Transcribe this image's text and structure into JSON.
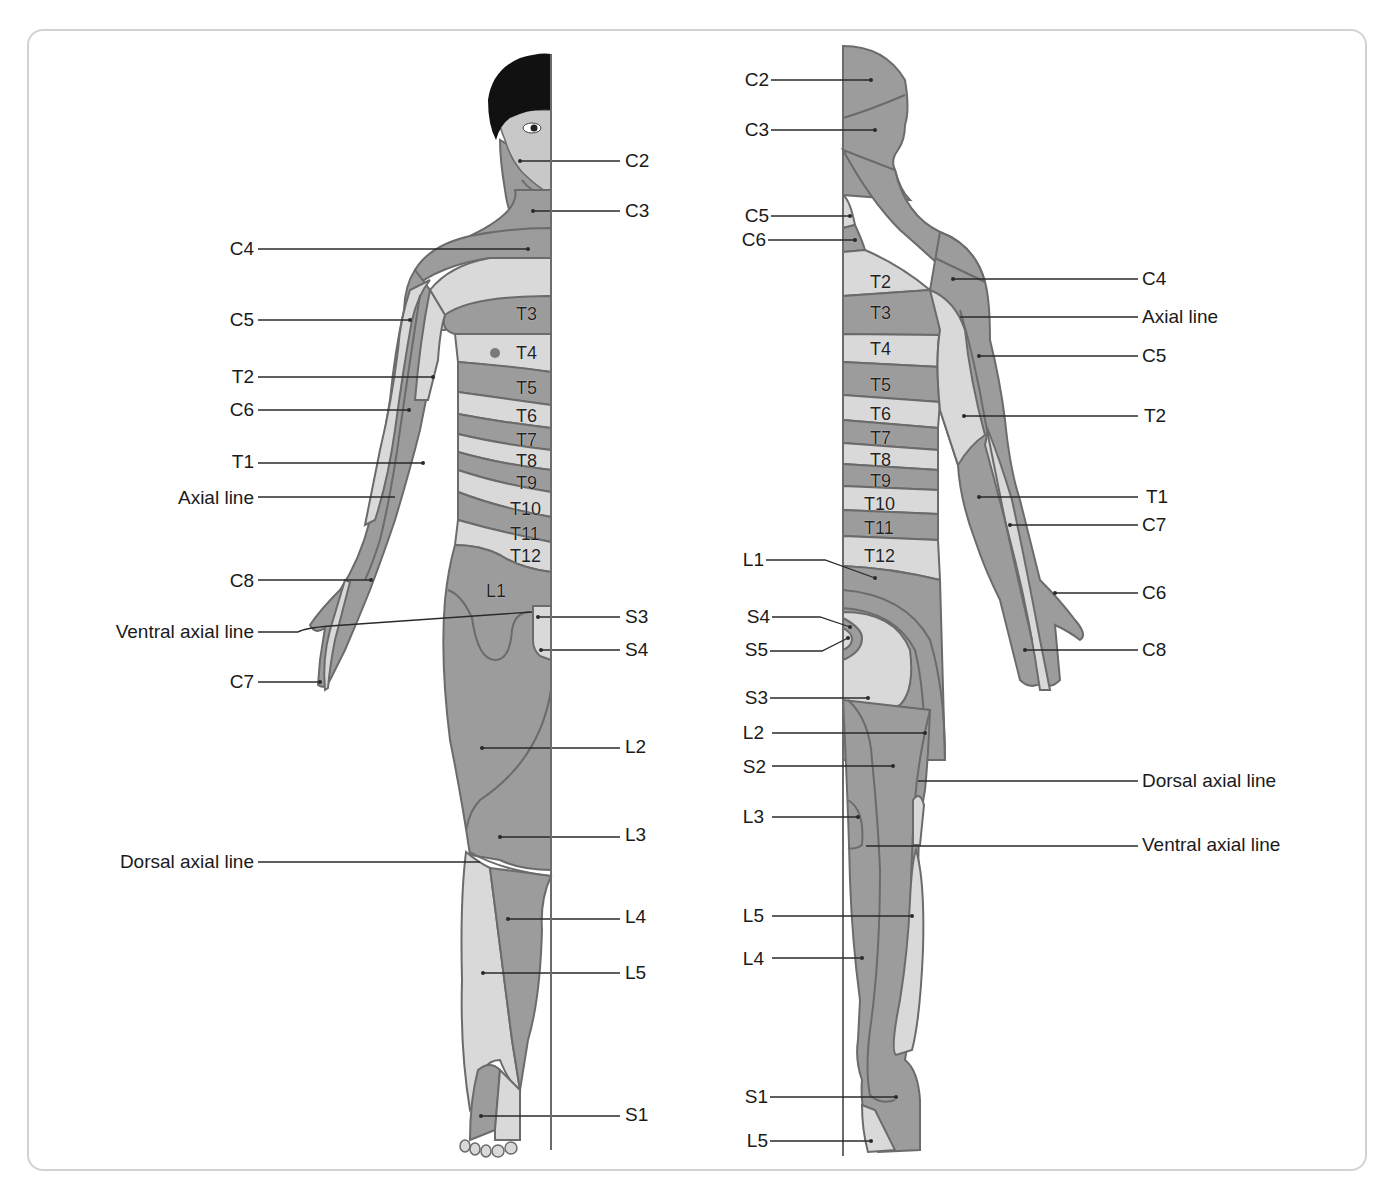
{
  "figure": {
    "colors": {
      "dark_zone": "#9c9c9c",
      "light_zone": "#d9d9d9",
      "outline": "#6b6b6b",
      "leader": "#2a2a2a",
      "hair": "#111111",
      "frame": "#d2d2d2"
    }
  },
  "anterior": {
    "right_labels": [
      {
        "text": "C2",
        "x": 625,
        "y": 151
      },
      {
        "text": "C3",
        "x": 625,
        "y": 201
      },
      {
        "text": "S3",
        "x": 625,
        "y": 607
      },
      {
        "text": "S4",
        "x": 625,
        "y": 640
      },
      {
        "text": "L2",
        "x": 625,
        "y": 737
      },
      {
        "text": "L3",
        "x": 625,
        "y": 825
      },
      {
        "text": "L4",
        "x": 625,
        "y": 907
      },
      {
        "text": "L5",
        "x": 625,
        "y": 963
      },
      {
        "text": "S1",
        "x": 625,
        "y": 1105
      }
    ],
    "left_labels": [
      {
        "text": "C4",
        "right": 1138,
        "y": 239
      },
      {
        "text": "C5",
        "right": 1138,
        "y": 310
      },
      {
        "text": "T2",
        "right": 1138,
        "y": 367
      },
      {
        "text": "C6",
        "right": 1138,
        "y": 400
      },
      {
        "text": "T1",
        "right": 1138,
        "y": 452
      },
      {
        "text": "Axial line",
        "right": 1138,
        "y": 488
      },
      {
        "text": "C8",
        "right": 1138,
        "y": 571
      },
      {
        "text": "Ventral axial line",
        "right": 1138,
        "y": 622
      },
      {
        "text": "C7",
        "right": 1138,
        "y": 672
      },
      {
        "text": "Dorsal axial line",
        "right": 1138,
        "y": 852
      }
    ],
    "segment_labels": [
      {
        "text": "T3",
        "x": 516,
        "y": 305
      },
      {
        "text": "T4",
        "x": 516,
        "y": 344
      },
      {
        "text": "T5",
        "x": 516,
        "y": 379
      },
      {
        "text": "T6",
        "x": 516,
        "y": 407
      },
      {
        "text": "T7",
        "x": 516,
        "y": 431
      },
      {
        "text": "T8",
        "x": 516,
        "y": 452
      },
      {
        "text": "T9",
        "x": 516,
        "y": 474
      },
      {
        "text": "T10",
        "x": 510,
        "y": 500
      },
      {
        "text": "T11",
        "x": 510,
        "y": 525
      },
      {
        "text": "T12",
        "x": 510,
        "y": 547
      },
      {
        "text": "L1",
        "x": 486,
        "y": 582
      }
    ]
  },
  "posterior": {
    "left_labels": [
      {
        "text": "C2",
        "right": 623,
        "y": 70
      },
      {
        "text": "C3",
        "right": 623,
        "y": 120
      },
      {
        "text": "C5",
        "right": 623,
        "y": 206
      },
      {
        "text": "C6",
        "right": 623,
        "y": 230
      },
      {
        "text": "L1",
        "right": 628,
        "y": 550
      },
      {
        "text": "S4",
        "right": 628,
        "y": 607
      },
      {
        "text": "S5",
        "right": 628,
        "y": 640
      },
      {
        "text": "S3",
        "right": 628,
        "y": 688
      },
      {
        "text": "L2",
        "right": 628,
        "y": 723
      },
      {
        "text": "S2",
        "right": 628,
        "y": 757
      },
      {
        "text": "L3",
        "right": 628,
        "y": 807
      },
      {
        "text": "L5",
        "right": 628,
        "y": 906
      },
      {
        "text": "L4",
        "right": 628,
        "y": 949
      },
      {
        "text": "S1",
        "right": 625,
        "y": 1087
      },
      {
        "text": "L5",
        "right": 625,
        "y": 1131
      }
    ],
    "right_labels": [
      {
        "text": "C4",
        "x": 1142,
        "y": 269
      },
      {
        "text": "Axial line",
        "x": 1142,
        "y": 307
      },
      {
        "text": "C5",
        "x": 1142,
        "y": 346
      },
      {
        "text": "T2",
        "x": 1144,
        "y": 406
      },
      {
        "text": "T1",
        "x": 1146,
        "y": 487
      },
      {
        "text": "C7",
        "x": 1142,
        "y": 515
      },
      {
        "text": "C6",
        "x": 1142,
        "y": 583
      },
      {
        "text": "C8",
        "x": 1142,
        "y": 640
      },
      {
        "text": "Dorsal axial line",
        "x": 1142,
        "y": 771
      },
      {
        "text": "Ventral axial line",
        "x": 1142,
        "y": 835
      }
    ],
    "segment_labels": [
      {
        "text": "T2",
        "x": 870,
        "y": 273
      },
      {
        "text": "T3",
        "x": 870,
        "y": 304
      },
      {
        "text": "T4",
        "x": 870,
        "y": 340
      },
      {
        "text": "T5",
        "x": 870,
        "y": 376
      },
      {
        "text": "T6",
        "x": 870,
        "y": 405
      },
      {
        "text": "T7",
        "x": 870,
        "y": 429
      },
      {
        "text": "T8",
        "x": 870,
        "y": 451
      },
      {
        "text": "T9",
        "x": 870,
        "y": 472
      },
      {
        "text": "T10",
        "x": 864,
        "y": 495
      },
      {
        "text": "T11",
        "x": 864,
        "y": 519
      },
      {
        "text": "T12",
        "x": 864,
        "y": 547
      }
    ]
  }
}
